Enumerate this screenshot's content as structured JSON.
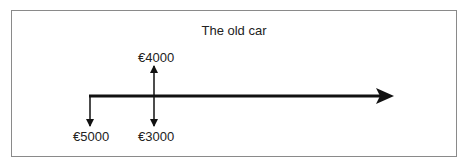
{
  "diagram": {
    "title": "The old car",
    "type": "cash-flow timeline",
    "flows": [
      {
        "label": "€5000",
        "direction": "out",
        "time": 0
      },
      {
        "label": "€4000",
        "direction": "in",
        "time": 1
      },
      {
        "label": "€3000",
        "direction": "out",
        "time": 1
      }
    ]
  }
}
